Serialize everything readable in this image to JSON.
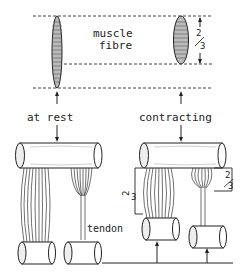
{
  "labels": {
    "muscle_line1": "muscle",
    "muscle_line2": "fibre",
    "at_rest": "at rest",
    "contracting": "contracting",
    "tendon": "tendon"
  },
  "fractions": {
    "top_right": "2/3",
    "contract_left": "2/3",
    "contract_right": "2/3",
    "num": "2",
    "den": "3"
  },
  "colors": {
    "ink": "#222222",
    "background": "#ffffff",
    "shade": "#9a9a9a"
  }
}
